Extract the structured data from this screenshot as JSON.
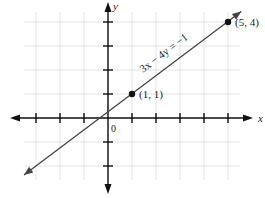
{
  "chart_data": {
    "type": "line",
    "title": "",
    "xlabel": "x",
    "ylabel": "y",
    "origin_label": "0",
    "xlim": [
      -4,
      6
    ],
    "ylim": [
      -3,
      5
    ],
    "x_ticks": [
      -3,
      -2,
      -1,
      1,
      2,
      3,
      4,
      5
    ],
    "y_ticks": [
      -2,
      -1,
      1,
      2,
      3,
      4
    ],
    "grid": true,
    "legend": null,
    "series": [
      {
        "name": "3x − 4y = −1",
        "equation": "3x − 4y = −1",
        "slope": 0.75,
        "intercept": 0.25,
        "x": [
          -3.5,
          5.55
        ],
        "y": [
          -2.375,
          4.4375
        ]
      }
    ],
    "points": [
      {
        "x": 1,
        "y": 1,
        "label": "(1, 1)"
      },
      {
        "x": 5,
        "y": 4,
        "label": "(5, 4)"
      }
    ],
    "annotations": [
      {
        "text": "3x − 4y = −1",
        "position": "along line, above",
        "rotation_deg": -36.87
      }
    ]
  },
  "colors": {
    "axis": "#111111",
    "grid": "#e4e4e4",
    "line": "#444444",
    "point": "#111111"
  }
}
